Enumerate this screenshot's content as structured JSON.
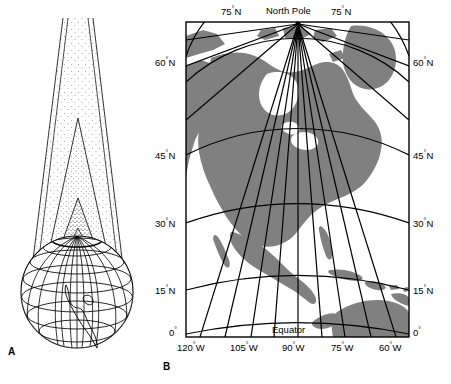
{
  "figure": {
    "panels": [
      {
        "id": "A",
        "label": "A",
        "name": "globe-with-projection-cone",
        "description": "Globe with nested stippled projection cones tangent to a parallel"
      },
      {
        "id": "B",
        "label": "B",
        "name": "conic-projection-map",
        "description": "Conic projection map of North America with graticule"
      }
    ]
  },
  "map": {
    "pole_label": "North Pole",
    "equator_label": "Equator",
    "land_color": "#808080",
    "ocean_color": "#ffffff",
    "graticule_color": "#000000",
    "frame_color": "#000000",
    "top_labels": [
      {
        "text": "75",
        "deg": "°",
        "suffix": "N",
        "x": 243,
        "y": 14
      },
      {
        "text": "75",
        "deg": "°",
        "suffix": "N",
        "x": 353,
        "y": 14
      }
    ],
    "latitude_labels_left": [
      {
        "text": "60",
        "deg": "°",
        "suffix": "N",
        "y": 62
      },
      {
        "text": "45",
        "deg": "°",
        "suffix": "N",
        "y": 155
      },
      {
        "text": "30",
        "deg": "°",
        "suffix": "N",
        "y": 223
      },
      {
        "text": "15",
        "deg": "°",
        "suffix": "N",
        "y": 290
      },
      {
        "text": "0",
        "deg": "°",
        "suffix": "",
        "y": 332
      }
    ],
    "latitude_labels_right": [
      {
        "text": "60",
        "deg": "°",
        "suffix": "N",
        "y": 62
      },
      {
        "text": "45",
        "deg": "°",
        "suffix": "N",
        "y": 155
      },
      {
        "text": "30",
        "deg": "°",
        "suffix": "N",
        "y": 223
      },
      {
        "text": "15",
        "deg": "°",
        "suffix": "N",
        "y": 290
      },
      {
        "text": "0",
        "deg": "°",
        "suffix": "",
        "y": 332
      }
    ],
    "longitude_labels": [
      {
        "text": "120",
        "deg": "°",
        "suffix": "W",
        "x": 200
      },
      {
        "text": "105",
        "deg": "°",
        "suffix": "W",
        "x": 252
      },
      {
        "text": "90",
        "deg": "°",
        "suffix": "W",
        "x": 300
      },
      {
        "text": "75",
        "deg": "°",
        "suffix": "W",
        "x": 349
      },
      {
        "text": "60",
        "deg": "°",
        "suffix": "W",
        "x": 397
      }
    ]
  }
}
